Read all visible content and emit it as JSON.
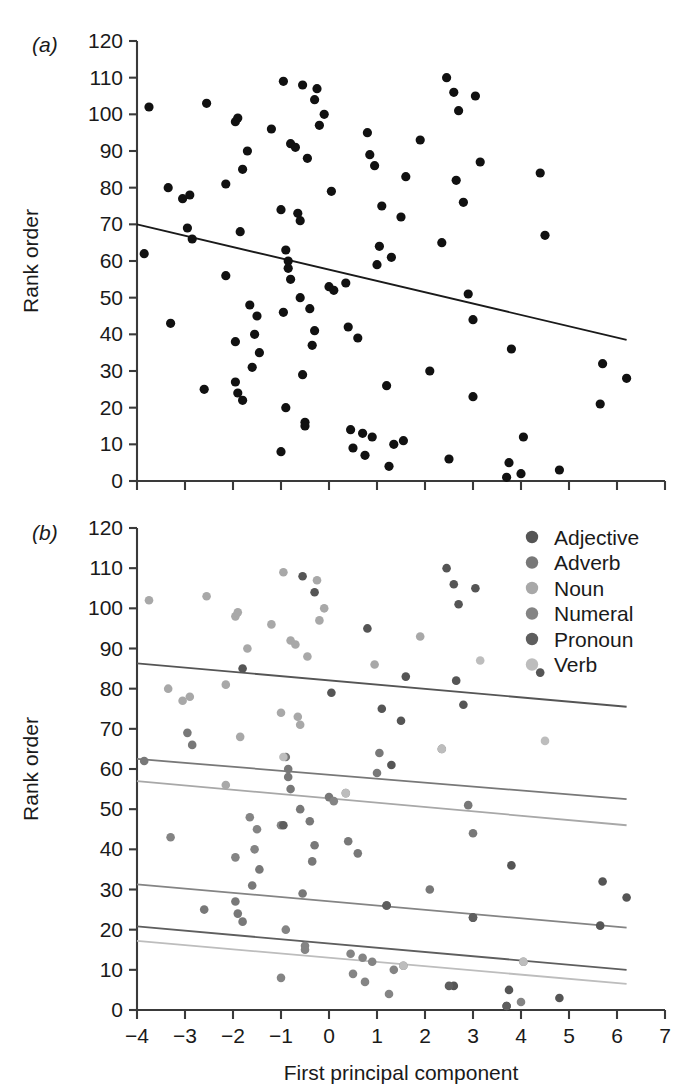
{
  "figure": {
    "panel_a_label": "(a)",
    "panel_b_label": "(b)",
    "x_axis_title": "First principal component",
    "y_axis_title_a": "Rank order",
    "y_axis_title_b": "Rank order"
  },
  "legend": {
    "position": "top-right of panel b",
    "items": [
      {
        "label": "Adjective",
        "color": "#555555"
      },
      {
        "label": "Adverb",
        "color": "#787878"
      },
      {
        "label": "Noun",
        "color": "#a8a8a8"
      },
      {
        "label": "Numeral",
        "color": "#848484"
      },
      {
        "label": "Pronoun",
        "color": "#5e5e5e"
      },
      {
        "label": "Verb",
        "color": "#bdbdbd"
      }
    ]
  },
  "chart_data": [
    {
      "type": "scatter",
      "panel": "(a)",
      "title": "",
      "xlabel": "First principal component",
      "ylabel": "Rank order",
      "xlim": [
        -4,
        7
      ],
      "ylim": [
        0,
        120
      ],
      "xticks": [
        -4,
        -3,
        -2,
        -1,
        0,
        1,
        2,
        3,
        4,
        5,
        6,
        7
      ],
      "xtick_labels": [
        "−4",
        "−3",
        "−2",
        "−1",
        "0",
        "1",
        "2",
        "3",
        "4",
        "5",
        "6",
        "7"
      ],
      "yticks": [
        0,
        10,
        20,
        30,
        40,
        50,
        60,
        70,
        80,
        90,
        100,
        110,
        120
      ],
      "ytick_labels": [
        "0",
        "10",
        "20",
        "30",
        "40",
        "50",
        "60",
        "70",
        "80",
        "90",
        "100",
        "110",
        "120"
      ],
      "grid": false,
      "legend": false,
      "marker_color": "#111111",
      "marker_size": 4.6,
      "trend_line": {
        "color": "#1a1a1a",
        "x_start": -4.0,
        "y_start": 70.0,
        "x_end": 6.2,
        "y_end": 38.5
      },
      "points": [
        [
          -3.85,
          62
        ],
        [
          -3.75,
          102
        ],
        [
          -3.35,
          80
        ],
        [
          -3.3,
          43
        ],
        [
          -3.05,
          77
        ],
        [
          -2.95,
          69
        ],
        [
          -2.9,
          78
        ],
        [
          -2.85,
          66
        ],
        [
          -2.6,
          25
        ],
        [
          -2.55,
          103
        ],
        [
          -2.15,
          81
        ],
        [
          -2.15,
          56
        ],
        [
          -1.95,
          98
        ],
        [
          -1.95,
          38
        ],
        [
          -1.95,
          27
        ],
        [
          -1.9,
          24
        ],
        [
          -1.9,
          99
        ],
        [
          -1.85,
          68
        ],
        [
          -1.8,
          85
        ],
        [
          -1.8,
          22
        ],
        [
          -1.7,
          90
        ],
        [
          -1.65,
          48
        ],
        [
          -1.6,
          31
        ],
        [
          -1.55,
          40
        ],
        [
          -1.5,
          45
        ],
        [
          -1.45,
          35
        ],
        [
          -1.2,
          96
        ],
        [
          -1.0,
          74
        ],
        [
          -1.0,
          8
        ],
        [
          -0.95,
          109
        ],
        [
          -0.95,
          46
        ],
        [
          -0.9,
          63
        ],
        [
          -0.9,
          20
        ],
        [
          -0.85,
          60
        ],
        [
          -0.85,
          58
        ],
        [
          -0.8,
          92
        ],
        [
          -0.8,
          55
        ],
        [
          -0.7,
          91
        ],
        [
          -0.65,
          73
        ],
        [
          -0.6,
          71
        ],
        [
          -0.6,
          50
        ],
        [
          -0.55,
          108
        ],
        [
          -0.55,
          29
        ],
        [
          -0.5,
          16
        ],
        [
          -0.5,
          15
        ],
        [
          -0.45,
          88
        ],
        [
          -0.4,
          47
        ],
        [
          -0.35,
          37
        ],
        [
          -0.3,
          104
        ],
        [
          -0.3,
          41
        ],
        [
          -0.25,
          107
        ],
        [
          -0.2,
          97
        ],
        [
          -0.1,
          100
        ],
        [
          0.0,
          53
        ],
        [
          0.05,
          79
        ],
        [
          0.1,
          52
        ],
        [
          0.35,
          54
        ],
        [
          0.4,
          42
        ],
        [
          0.45,
          14
        ],
        [
          0.5,
          9
        ],
        [
          0.6,
          39
        ],
        [
          0.7,
          13
        ],
        [
          0.75,
          7
        ],
        [
          0.8,
          95
        ],
        [
          0.85,
          89
        ],
        [
          0.9,
          12
        ],
        [
          0.95,
          86
        ],
        [
          1.0,
          59
        ],
        [
          1.05,
          64
        ],
        [
          1.1,
          75
        ],
        [
          1.2,
          26
        ],
        [
          1.25,
          4
        ],
        [
          1.3,
          61
        ],
        [
          1.35,
          10
        ],
        [
          1.5,
          72
        ],
        [
          1.55,
          11
        ],
        [
          1.6,
          83
        ],
        [
          1.9,
          93
        ],
        [
          2.1,
          30
        ],
        [
          2.35,
          65
        ],
        [
          2.45,
          110
        ],
        [
          2.5,
          6
        ],
        [
          2.6,
          106
        ],
        [
          2.65,
          82
        ],
        [
          2.7,
          101
        ],
        [
          2.8,
          76
        ],
        [
          2.9,
          51
        ],
        [
          3.0,
          23
        ],
        [
          3.0,
          44
        ],
        [
          3.05,
          105
        ],
        [
          3.15,
          87
        ],
        [
          3.7,
          1
        ],
        [
          3.75,
          5
        ],
        [
          3.8,
          36
        ],
        [
          4.0,
          2
        ],
        [
          4.05,
          12
        ],
        [
          4.4,
          84
        ],
        [
          4.5,
          67
        ],
        [
          4.8,
          3
        ],
        [
          5.65,
          21
        ],
        [
          5.7,
          32
        ],
        [
          6.2,
          28
        ]
      ]
    },
    {
      "type": "scatter",
      "panel": "(b)",
      "title": "",
      "xlabel": "First principal component",
      "ylabel": "Rank order",
      "xlim": [
        -4,
        7
      ],
      "ylim": [
        0,
        120
      ],
      "xticks": [
        -4,
        -3,
        -2,
        -1,
        0,
        1,
        2,
        3,
        4,
        5,
        6,
        7
      ],
      "xtick_labels": [
        "−4",
        "−3",
        "−2",
        "−1",
        "0",
        "1",
        "2",
        "3",
        "4",
        "5",
        "6",
        "7"
      ],
      "yticks": [
        0,
        10,
        20,
        30,
        40,
        50,
        60,
        70,
        80,
        90,
        100,
        110,
        120
      ],
      "ytick_labels": [
        "0",
        "10",
        "20",
        "30",
        "40",
        "50",
        "60",
        "70",
        "80",
        "90",
        "100",
        "110",
        "120"
      ],
      "grid": false,
      "legend": true,
      "legend_position": "top-right",
      "marker_size": 4.3,
      "series": [
        {
          "name": "Adjective",
          "color": "#555555",
          "fit": {
            "x_start": -4.0,
            "y_start": 86.3,
            "x_end": 6.2,
            "y_end": 75.5
          },
          "points": [
            [
              -1.8,
              85
            ],
            [
              -0.55,
              108
            ],
            [
              -0.3,
              104
            ],
            [
              0.05,
              79
            ],
            [
              0.8,
              95
            ],
            [
              1.1,
              75
            ],
            [
              1.3,
              61
            ],
            [
              1.5,
              72
            ],
            [
              1.6,
              83
            ],
            [
              2.45,
              110
            ],
            [
              2.6,
              106
            ],
            [
              2.65,
              82
            ],
            [
              2.7,
              101
            ],
            [
              2.8,
              76
            ],
            [
              3.05,
              105
            ],
            [
              4.4,
              84
            ],
            [
              3.7,
              1
            ],
            [
              2.6,
              6
            ],
            [
              3.75,
              5
            ],
            [
              4.8,
              3
            ],
            [
              5.7,
              32
            ],
            [
              6.2,
              28
            ],
            [
              5.65,
              21
            ],
            [
              3.0,
              23
            ],
            [
              1.2,
              26
            ],
            [
              3.8,
              36
            ]
          ]
        },
        {
          "name": "Adverb",
          "color": "#787878",
          "fit": {
            "x_start": -4.0,
            "y_start": 62.5,
            "x_end": 6.2,
            "y_end": 52.5
          },
          "points": [
            [
              -3.85,
              62
            ],
            [
              -2.95,
              69
            ],
            [
              -2.85,
              66
            ],
            [
              -1.95,
              27
            ],
            [
              -1.9,
              24
            ],
            [
              -1.6,
              31
            ],
            [
              -1.45,
              35
            ],
            [
              -0.9,
              63
            ],
            [
              -0.85,
              60
            ],
            [
              -0.85,
              58
            ],
            [
              -0.8,
              55
            ],
            [
              -0.6,
              50
            ],
            [
              -0.4,
              47
            ],
            [
              -0.35,
              37
            ],
            [
              -0.3,
              41
            ],
            [
              0.0,
              53
            ],
            [
              0.4,
              42
            ],
            [
              0.6,
              39
            ],
            [
              1.0,
              59
            ],
            [
              1.05,
              64
            ],
            [
              2.1,
              30
            ],
            [
              2.35,
              65
            ],
            [
              2.9,
              51
            ],
            [
              3.0,
              44
            ],
            [
              -0.55,
              29
            ],
            [
              -2.6,
              25
            ],
            [
              -1.8,
              22
            ]
          ]
        },
        {
          "name": "Noun",
          "color": "#a8a8a8",
          "fit": {
            "x_start": -4.0,
            "y_start": 57.0,
            "x_end": 6.2,
            "y_end": 46.0
          },
          "points": [
            [
              -3.35,
              80
            ],
            [
              -3.05,
              77
            ],
            [
              -2.9,
              78
            ],
            [
              -2.55,
              103
            ],
            [
              -2.15,
              81
            ],
            [
              -2.15,
              56
            ],
            [
              -1.95,
              98
            ],
            [
              -1.9,
              99
            ],
            [
              -1.85,
              68
            ],
            [
              -1.7,
              90
            ],
            [
              -1.2,
              96
            ],
            [
              -1.0,
              74
            ],
            [
              -0.8,
              92
            ],
            [
              -0.7,
              91
            ],
            [
              -0.65,
              73
            ],
            [
              -0.6,
              71
            ],
            [
              -0.45,
              88
            ],
            [
              -0.25,
              107
            ],
            [
              -0.2,
              97
            ],
            [
              -0.1,
              100
            ],
            [
              0.95,
              86
            ],
            [
              1.9,
              93
            ],
            [
              -3.75,
              102
            ],
            [
              -0.95,
              109
            ]
          ]
        },
        {
          "name": "Numeral",
          "color": "#848484",
          "fit": {
            "x_start": -4.0,
            "y_start": 31.3,
            "x_end": 6.2,
            "y_end": 20.5
          },
          "points": [
            [
              -3.3,
              43
            ],
            [
              -1.95,
              38
            ],
            [
              -1.65,
              48
            ],
            [
              -1.55,
              40
            ],
            [
              -1.5,
              45
            ],
            [
              -1.0,
              46
            ],
            [
              -0.9,
              20
            ],
            [
              -0.5,
              16
            ],
            [
              -0.5,
              15
            ],
            [
              0.1,
              52
            ],
            [
              0.35,
              54
            ],
            [
              0.45,
              14
            ],
            [
              0.7,
              13
            ],
            [
              0.75,
              7
            ],
            [
              0.9,
              12
            ],
            [
              1.35,
              10
            ],
            [
              1.55,
              11
            ],
            [
              0.5,
              9
            ],
            [
              -1.0,
              8
            ],
            [
              1.25,
              4
            ],
            [
              4.05,
              12
            ],
            [
              4.0,
              2
            ]
          ]
        },
        {
          "name": "Pronoun",
          "color": "#5e5e5e",
          "fit": {
            "x_start": -4.0,
            "y_start": 20.8,
            "x_end": 6.2,
            "y_end": 10.0
          },
          "points": [
            [
              -0.95,
              46
            ],
            [
              1.2,
              26
            ],
            [
              3.0,
              23
            ],
            [
              2.5,
              6
            ],
            [
              3.7,
              1
            ]
          ]
        },
        {
          "name": "Verb",
          "color": "#bdbdbd",
          "fit": {
            "x_start": -4.0,
            "y_start": 17.2,
            "x_end": 6.2,
            "y_end": 6.5
          },
          "points": [
            [
              -0.95,
              63
            ],
            [
              0.35,
              54
            ],
            [
              1.55,
              11
            ],
            [
              4.5,
              67
            ],
            [
              3.15,
              87
            ],
            [
              2.35,
              65
            ],
            [
              4.05,
              12
            ]
          ]
        }
      ]
    }
  ]
}
